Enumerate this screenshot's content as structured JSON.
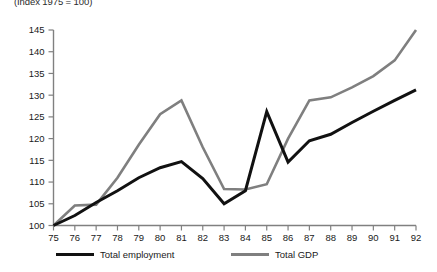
{
  "chart_data": {
    "type": "line",
    "title": "",
    "subtitle": "(Index 1975 = 100)",
    "xlabel": "",
    "ylabel": "",
    "x": [
      75,
      76,
      77,
      78,
      79,
      80,
      81,
      82,
      83,
      84,
      85,
      86,
      87,
      88,
      89,
      90,
      91,
      92
    ],
    "xlim": [
      75,
      92
    ],
    "ylim": [
      100,
      145
    ],
    "yticks": [
      100,
      105,
      110,
      115,
      120,
      125,
      130,
      135,
      140,
      145
    ],
    "xticks": [
      75,
      76,
      77,
      78,
      79,
      80,
      81,
      82,
      83,
      84,
      85,
      86,
      87,
      88,
      89,
      90,
      91,
      92
    ],
    "grid": false,
    "legend_position": "bottom",
    "series": [
      {
        "name": "Total employment",
        "color": "#111111",
        "width": 3.0,
        "values": [
          100.0,
          102.3,
          105.3,
          108.0,
          111.0,
          113.3,
          114.7,
          110.8,
          105.0,
          108.0,
          126.2,
          114.6,
          119.5,
          121.0,
          123.7,
          126.3,
          128.8,
          131.2
        ]
      },
      {
        "name": "Total GDP",
        "color": "#7f7f7f",
        "width": 2.6,
        "values": [
          100.0,
          104.6,
          104.8,
          111.0,
          118.6,
          125.6,
          128.8,
          118.0,
          108.4,
          108.3,
          109.5,
          120.0,
          128.8,
          129.5,
          131.8,
          134.4,
          138.0,
          145.0
        ]
      }
    ]
  },
  "legend": {
    "entries": [
      {
        "label": "Total employment"
      },
      {
        "label": "Total GDP"
      }
    ]
  },
  "axis": {
    "y_tick_labels": [
      "145",
      "140",
      "135",
      "130",
      "125",
      "120",
      "115",
      "110",
      "105",
      "100"
    ],
    "x_tick_labels": [
      "75",
      "76",
      "77",
      "78",
      "79",
      "80",
      "81",
      "82",
      "83",
      "84",
      "85",
      "86",
      "87",
      "88",
      "89",
      "90",
      "91",
      "92"
    ]
  }
}
